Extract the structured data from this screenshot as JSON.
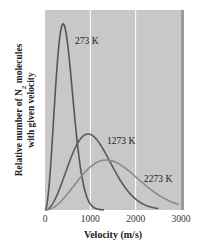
{
  "chart_data": {
    "type": "line",
    "title": "",
    "xlabel": "Velocity (m/s)",
    "ylabel_line1": "Relative number of N",
    "ylabel_sub": "2",
    "ylabel_line1_suffix": " molecules",
    "ylabel_line2": "with given velocity",
    "xlim": [
      0,
      3000
    ],
    "ylim": [
      0,
      1
    ],
    "xticks": [
      0,
      1000,
      2000,
      3000
    ],
    "xtick_labels": [
      "0",
      "1000",
      "2000",
      "3000"
    ],
    "grid": {
      "vertical_at": [
        1000,
        2000
      ],
      "color": "#ffffff"
    },
    "background": "#c8c8c8",
    "series": [
      {
        "name": "273 K",
        "label": "273 K",
        "peak_velocity": 400,
        "peak_relative": 0.93,
        "end_velocity": 1300,
        "color": "#555555",
        "label_pos": [
          75,
          44
        ]
      },
      {
        "name": "1273 K",
        "label": "1273 K",
        "peak_velocity": 950,
        "peak_relative": 0.38,
        "end_velocity": 2500,
        "color": "#5a5a5a",
        "label_pos": [
          107,
          144
        ]
      },
      {
        "name": "2273 K",
        "label": "2273 K",
        "peak_velocity": 1350,
        "peak_relative": 0.25,
        "end_velocity": 2950,
        "color": "#8a8a8a",
        "label_pos": [
          144,
          182
        ]
      }
    ]
  }
}
